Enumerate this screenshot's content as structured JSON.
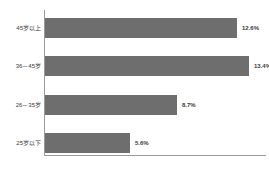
{
  "chart_data": {
    "type": "bar",
    "orientation": "horizontal",
    "title": "",
    "subtitle": "",
    "xlabel": "",
    "ylabel": "",
    "grid": false,
    "legend": false,
    "legend_position": "none",
    "axis_range": [
      0,
      14.5
    ],
    "value_suffix": "%",
    "bar_color": "#6e6e6e",
    "axis_color": "#9a9a9a",
    "label_color": "#3b3b3b",
    "categories": [
      "45岁以上",
      "36－45岁",
      "26－35岁",
      "25岁以下"
    ],
    "values": [
      12.6,
      13.4,
      8.7,
      5.6
    ],
    "bars": [
      {
        "category": "45岁以上",
        "value": 12.6,
        "value_label": "12.6%"
      },
      {
        "category": "36－45岁",
        "value": 13.4,
        "value_label": "13.4%"
      },
      {
        "category": "26－35岁",
        "value": 8.7,
        "value_label": "8.7%"
      },
      {
        "category": "25岁以下",
        "value": 5.6,
        "value_label": "5.6%"
      }
    ]
  }
}
